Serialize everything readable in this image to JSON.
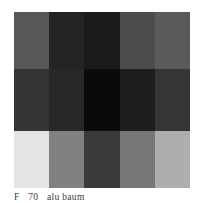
{
  "figure": {
    "type": "grayscale-block-image",
    "caption": {
      "visible_text": "F       70 alu baum",
      "label_token": "F",
      "number_token": "70",
      "trailing_tokens": "alu baum",
      "clipped": "true"
    },
    "image": {
      "columns": 5,
      "rows": 3,
      "width_px": 176,
      "height_px": 176,
      "border_color": "#6d6d6f",
      "grid": [
        [
          {
            "name": "r1c1",
            "color": "#58585a"
          },
          {
            "name": "r1c2",
            "color": "#232325"
          },
          {
            "name": "r1c3",
            "color": "#1a1a1c"
          },
          {
            "name": "r1c4",
            "color": "#4d4d4f"
          },
          {
            "name": "r1c5",
            "color": "#5a5a5c"
          }
        ],
        [
          {
            "name": "r2c1",
            "color": "#343436"
          },
          {
            "name": "r2c2",
            "color": "#28282a"
          },
          {
            "name": "r2c3",
            "color": "#0a0a0c"
          },
          {
            "name": "r2c4",
            "color": "#1e1e20"
          },
          {
            "name": "r2c5",
            "color": "#353537"
          }
        ],
        [
          {
            "name": "r3c1",
            "color": "#e4e4e2"
          },
          {
            "name": "r3c2",
            "color": "#818183"
          },
          {
            "name": "r3c3",
            "color": "#3a3a3c"
          },
          {
            "name": "r3c4",
            "color": "#77777a"
          },
          {
            "name": "r3c5",
            "color": "#aeaeb0"
          }
        ]
      ]
    }
  }
}
